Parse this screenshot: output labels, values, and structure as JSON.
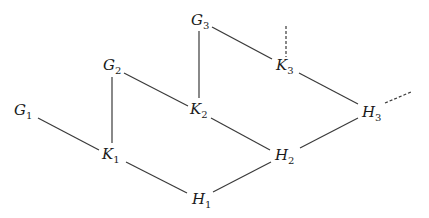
{
  "diagram": {
    "type": "lattice-graph",
    "nodes": [
      {
        "id": "G1",
        "base": "G",
        "sub": "1"
      },
      {
        "id": "G2",
        "base": "G",
        "sub": "2"
      },
      {
        "id": "G3",
        "base": "G",
        "sub": "3"
      },
      {
        "id": "K1",
        "base": "K",
        "sub": "1"
      },
      {
        "id": "K2",
        "base": "K",
        "sub": "2"
      },
      {
        "id": "K3",
        "base": "K",
        "sub": "3"
      },
      {
        "id": "H1",
        "base": "H",
        "sub": "1"
      },
      {
        "id": "H2",
        "base": "H",
        "sub": "2"
      },
      {
        "id": "H3",
        "base": "H",
        "sub": "3"
      }
    ],
    "edges": [
      {
        "from": "G1",
        "to": "K1",
        "style": "solid"
      },
      {
        "from": "G2",
        "to": "K1",
        "style": "solid"
      },
      {
        "from": "G2",
        "to": "K2",
        "style": "solid"
      },
      {
        "from": "G3",
        "to": "K2",
        "style": "solid"
      },
      {
        "from": "G3",
        "to": "K3",
        "style": "solid"
      },
      {
        "from": "K1",
        "to": "H1",
        "style": "solid"
      },
      {
        "from": "K2",
        "to": "H2",
        "style": "solid"
      },
      {
        "from": "K3",
        "to": "H3",
        "style": "solid"
      },
      {
        "from": "H1",
        "to": "H2",
        "style": "solid"
      },
      {
        "from": "H2",
        "to": "H3",
        "style": "solid"
      },
      {
        "from": "K3",
        "to": "continuation-up",
        "style": "dashed"
      },
      {
        "from": "H3",
        "to": "continuation-right",
        "style": "dashed"
      }
    ]
  }
}
